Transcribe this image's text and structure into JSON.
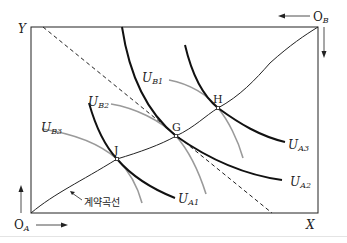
{
  "diagram": {
    "type": "edgeworth-box",
    "axes": {
      "x_label": "X",
      "y_label": "Y",
      "origin_a": {
        "main": "O",
        "sub": "A"
      },
      "origin_b": {
        "main": "O",
        "sub": "B"
      }
    },
    "points": [
      {
        "id": "J",
        "label": "J"
      },
      {
        "id": "G",
        "label": "G"
      },
      {
        "id": "H",
        "label": "H"
      }
    ],
    "curves": {
      "contract_curve_label": "계약곡선",
      "person_a_indifference": [
        {
          "main": "U",
          "sub": "A1"
        },
        {
          "main": "U",
          "sub": "A2"
        },
        {
          "main": "U",
          "sub": "A3"
        }
      ],
      "person_b_indifference": [
        {
          "main": "U",
          "sub": "B1"
        },
        {
          "main": "U",
          "sub": "B2"
        },
        {
          "main": "U",
          "sub": "B3"
        }
      ],
      "budget_line": "dashed price line tangent at G"
    },
    "colors": {
      "a_curves": "#111111",
      "b_curves": "#9a9a9a",
      "frame": "#222222"
    }
  }
}
